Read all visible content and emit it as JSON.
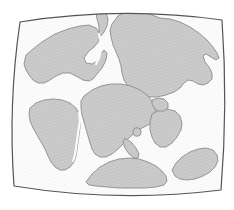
{
  "figure": {
    "projection": "barrel globe projection",
    "background_color": "#ffffff",
    "ocean_color": "#fbfbfb",
    "land_color": "#c9c9c9",
    "land_stroke_color": "#8c8c8c",
    "frame_stroke_color": "#555555",
    "hatch_color": "#bdbdbd",
    "frame": {
      "corners": {
        "top_left": [
          20,
          22
        ],
        "top_right": [
          222,
          20
        ],
        "bottom_right": [
          221,
          190
        ],
        "bottom_left": [
          14,
          186
        ]
      }
    },
    "landmasses": [
      {
        "name": "north-america",
        "label": "North America",
        "path": "M 24 64 L 26 55 L 33 49 L 42 42 L 55 34 L 68 29 L 80 26 L 89 25 L 96 28 L 100 34 L 99 41 L 94 47 L 88 52 L 84 58 L 86 63 L 92 64 L 96 62 L 99 58 L 101 53 L 104 50 L 107 53 L 106 60 L 102 68 L 97 74 L 93 79 L 89 81 L 83 80 L 76 76 L 70 73 L 63 73 L 56 76 L 50 80 L 44 83 L 38 83 L 33 80 L 29 75 L 26 70 Z"
      },
      {
        "name": "greenland-seaway-west",
        "label": "Greenland margin",
        "path": "M 96 12 L 101 10 L 106 13 L 108 19 L 107 26 L 104 32 L 101 36 L 99 33 L 99 26 L 97 19 Z"
      },
      {
        "name": "eurasia",
        "label": "Eurasia",
        "path": "M 112 24 L 118 16 L 126 11 L 135 9 L 144 11 L 152 15 L 160 18 L 170 19 L 180 22 L 190 27 L 199 33 L 207 40 L 213 47 L 217 53 L 219 58 L 216 60 L 211 57 L 206 54 L 203 56 L 205 62 L 209 67 L 212 73 L 212 79 L 208 83 L 203 85 L 198 84 L 193 81 L 188 80 L 184 83 L 180 88 L 174 92 L 166 95 L 157 97 L 148 97 L 140 95 L 133 91 L 128 86 L 124 80 L 122 73 L 121 66 L 119 59 L 116 52 L 113 45 L 111 37 L 110 30 Z"
      },
      {
        "name": "africa",
        "label": "Africa",
        "path": "M 84 96 L 92 90 L 101 86 L 111 84 L 121 84 L 131 86 L 140 90 L 147 95 L 152 101 L 155 108 L 156 115 L 153 121 L 148 125 L 142 128 L 136 132 L 130 137 L 124 143 L 118 149 L 112 154 L 106 157 L 100 157 L 95 154 L 92 149 L 90 143 L 88 136 L 86 129 L 84 122 L 82 115 L 81 108 L 81 101 Z"
      },
      {
        "name": "south-america",
        "label": "South America",
        "path": "M 30 108 L 36 103 L 44 100 L 53 99 L 62 100 L 70 103 L 76 108 L 79 114 L 80 121 L 80 128 L 79 135 L 78 142 L 77 149 L 76 156 L 74 162 L 70 167 L 65 170 L 60 170 L 55 167 L 51 162 L 48 156 L 45 149 L 41 142 L 37 135 L 33 128 L 30 121 L 29 114 Z"
      },
      {
        "name": "india",
        "label": "India",
        "path": "M 152 114 L 159 110 L 167 109 L 175 111 L 180 116 L 182 123 L 181 130 L 177 137 L 172 143 L 166 147 L 160 147 L 155 143 L 152 137 L 150 130 L 150 122 Z"
      },
      {
        "name": "madagascar",
        "label": "Madagascar",
        "path": "M 125 138 L 131 142 L 136 148 L 139 154 L 138 158 L 134 158 L 129 154 L 125 148 L 123 142 Z"
      },
      {
        "name": "sri-lanka",
        "label": "Sri Lanka",
        "path": "M 137 132 m -4 0 a 4 4.2 0 1 0 8 0 a 4 4.2 0 1 0 -8 0 Z"
      },
      {
        "name": "australia",
        "label": "Australia",
        "path": "M 172 170 L 176 163 L 182 157 L 190 152 L 198 149 L 206 148 L 213 150 L 217 155 L 218 161 L 215 167 L 210 172 L 203 176 L 195 179 L 187 180 L 180 179 L 175 176 Z"
      },
      {
        "name": "antarctica",
        "label": "Antarctica",
        "path": "M 86 182 L 92 174 L 100 167 L 109 162 L 119 159 L 129 158 L 139 159 L 148 162 L 156 166 L 162 171 L 166 176 L 167 181 L 164 185 L 156 187 L 145 188 L 132 188 L 119 188 L 107 187 L 96 186 L 89 185 Z"
      },
      {
        "name": "arabia-block",
        "label": "Arabia",
        "path": "M 152 100 L 158 98 L 164 99 L 168 103 L 168 108 L 164 111 L 158 111 L 154 108 L 152 104 Z"
      }
    ],
    "rift_lines": [
      {
        "name": "south-atlantic-rift",
        "label": "South Atlantic rift",
        "path": "M 79 113 L 80 120 L 79 127 L 78 134 L 77 141 L 76 148 L 75 155 L 73 161"
      },
      {
        "name": "north-atlantic-seaway",
        "label": "North Atlantic seaway",
        "path": "M 96 64 L 99 58 L 101 50 L 101 42 L 99 34"
      }
    ]
  }
}
